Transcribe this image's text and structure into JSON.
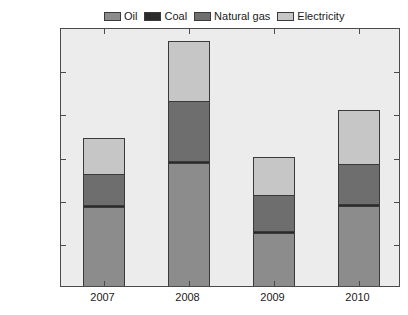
{
  "chart_data": {
    "type": "bar",
    "subtype": "stacked",
    "title": "",
    "xlabel": "",
    "ylabel": "Billion dollars",
    "categories": [
      "2007",
      "2008",
      "2009",
      "2010"
    ],
    "ylim": [
      0,
      600
    ],
    "yticks": [
      0,
      100,
      200,
      300,
      400,
      500,
      600
    ],
    "ytick_labels": [
      "0",
      "100",
      "200",
      "300",
      "400",
      "500",
      "600"
    ],
    "grid": false,
    "legend_position": "top",
    "series": [
      {
        "name": "Oil",
        "color": "#8c8c8c",
        "values": [
          183,
          285,
          122,
          186
        ]
      },
      {
        "name": "Coal",
        "color": "#2b2b2b",
        "values": [
          5,
          5,
          5,
          5
        ]
      },
      {
        "name": "Natural gas",
        "color": "#6e6e6e",
        "values": [
          72,
          138,
          83,
          92
        ]
      },
      {
        "name": "Electricity",
        "color": "#c6c6c6",
        "values": [
          82,
          139,
          90,
          125
        ]
      }
    ],
    "totals": [
      342,
      567,
      300,
      408
    ]
  },
  "colors": {
    "plot_background": "#ececec",
    "figure_background": "#ffffff",
    "axis": "#4a4a4a",
    "text": "#1a1a1a"
  }
}
